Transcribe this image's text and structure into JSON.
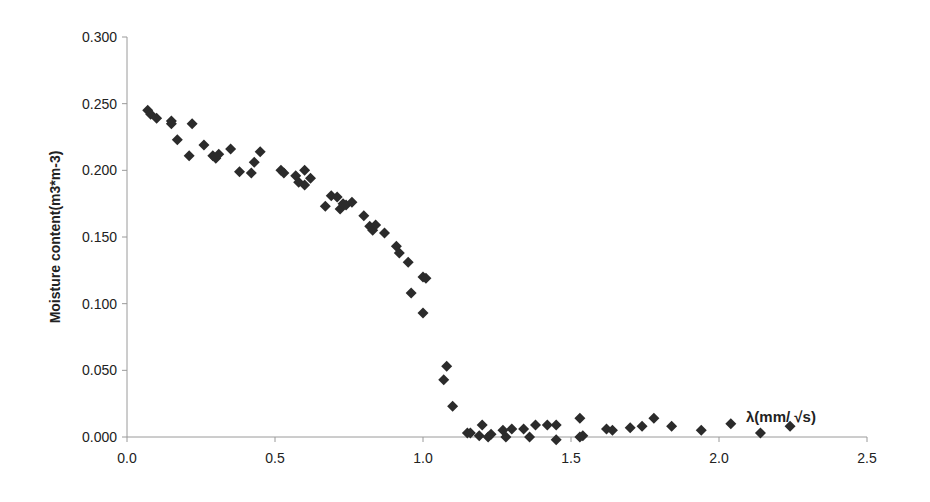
{
  "chart_data": {
    "type": "scatter",
    "title": "",
    "xlabel": "",
    "ylabel": "Moisture content(m3*m-3)",
    "annotation": "λ(mm/ √s)",
    "xlim": [
      0.0,
      2.5
    ],
    "ylim": [
      0.0,
      0.3
    ],
    "x_ticks": [
      "0.0",
      "0.5",
      "1.0",
      "1.5",
      "2.0",
      "2.5"
    ],
    "y_ticks": [
      "0.000",
      "0.050",
      "0.100",
      "0.150",
      "0.200",
      "0.250",
      "0.300"
    ],
    "grid": false,
    "legend": "none",
    "marker": "diamond",
    "marker_color": "#2b2b2b",
    "series": [
      {
        "name": "Moisture content",
        "points": [
          [
            0.07,
            0.245
          ],
          [
            0.08,
            0.242
          ],
          [
            0.1,
            0.239
          ],
          [
            0.15,
            0.237
          ],
          [
            0.15,
            0.235
          ],
          [
            0.17,
            0.223
          ],
          [
            0.21,
            0.211
          ],
          [
            0.22,
            0.235
          ],
          [
            0.26,
            0.219
          ],
          [
            0.29,
            0.211
          ],
          [
            0.3,
            0.209
          ],
          [
            0.31,
            0.212
          ],
          [
            0.35,
            0.216
          ],
          [
            0.38,
            0.199
          ],
          [
            0.42,
            0.198
          ],
          [
            0.43,
            0.206
          ],
          [
            0.45,
            0.214
          ],
          [
            0.52,
            0.2
          ],
          [
            0.53,
            0.198
          ],
          [
            0.57,
            0.196
          ],
          [
            0.58,
            0.191
          ],
          [
            0.6,
            0.2
          ],
          [
            0.6,
            0.189
          ],
          [
            0.62,
            0.194
          ],
          [
            0.67,
            0.173
          ],
          [
            0.69,
            0.181
          ],
          [
            0.71,
            0.18
          ],
          [
            0.72,
            0.171
          ],
          [
            0.73,
            0.175
          ],
          [
            0.74,
            0.174
          ],
          [
            0.76,
            0.176
          ],
          [
            0.8,
            0.166
          ],
          [
            0.82,
            0.158
          ],
          [
            0.83,
            0.155
          ],
          [
            0.84,
            0.159
          ],
          [
            0.87,
            0.153
          ],
          [
            0.91,
            0.143
          ],
          [
            0.92,
            0.138
          ],
          [
            0.95,
            0.131
          ],
          [
            0.96,
            0.108
          ],
          [
            1.0,
            0.12
          ],
          [
            1.01,
            0.119
          ],
          [
            1.0,
            0.093
          ],
          [
            1.08,
            0.053
          ],
          [
            1.07,
            0.043
          ],
          [
            1.1,
            0.023
          ],
          [
            1.15,
            0.003
          ],
          [
            1.16,
            0.003
          ],
          [
            1.19,
            0.001
          ],
          [
            1.2,
            0.009
          ],
          [
            1.22,
            0.0
          ],
          [
            1.23,
            0.002
          ],
          [
            1.27,
            0.005
          ],
          [
            1.28,
            0.0
          ],
          [
            1.3,
            0.006
          ],
          [
            1.34,
            0.006
          ],
          [
            1.36,
            0.0
          ],
          [
            1.38,
            0.009
          ],
          [
            1.42,
            0.009
          ],
          [
            1.45,
            0.009
          ],
          [
            1.45,
            -0.002
          ],
          [
            1.53,
            0.014
          ],
          [
            1.54,
            0.001
          ],
          [
            1.53,
            0.0
          ],
          [
            1.62,
            0.006
          ],
          [
            1.64,
            0.005
          ],
          [
            1.7,
            0.007
          ],
          [
            1.74,
            0.008
          ],
          [
            1.78,
            0.014
          ],
          [
            1.84,
            0.008
          ],
          [
            1.94,
            0.005
          ],
          [
            2.04,
            0.01
          ],
          [
            2.14,
            0.003
          ],
          [
            2.24,
            0.008
          ]
        ]
      }
    ]
  }
}
